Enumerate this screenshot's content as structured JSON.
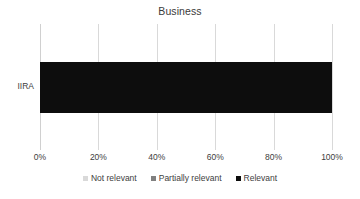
{
  "chart_data": {
    "type": "bar",
    "orientation": "horizontal",
    "stacked": true,
    "normalized_percent": true,
    "title": "Business",
    "xlabel": "",
    "ylabel": "",
    "categories": [
      "IIRA"
    ],
    "series": [
      {
        "name": "Not relevant",
        "values": [
          0
        ],
        "color": "#d9d9d9"
      },
      {
        "name": "Partially relevant",
        "values": [
          0
        ],
        "color": "#808080"
      },
      {
        "name": "Relevant",
        "values": [
          100
        ],
        "color": "#0d0d0d"
      }
    ],
    "xlim": [
      0,
      100
    ],
    "xticks": [
      0,
      20,
      40,
      60,
      80,
      100
    ],
    "xtick_labels": [
      "0%",
      "20%",
      "40%",
      "60%",
      "80%",
      "100%"
    ],
    "grid": "vertical",
    "legend_position": "bottom"
  },
  "colors": {
    "background": "#ffffff",
    "text": "#404040",
    "gridline": "#d9d9d9",
    "not_relevant": "#d9d9d9",
    "partially_relevant": "#808080",
    "relevant": "#0d0d0d"
  }
}
